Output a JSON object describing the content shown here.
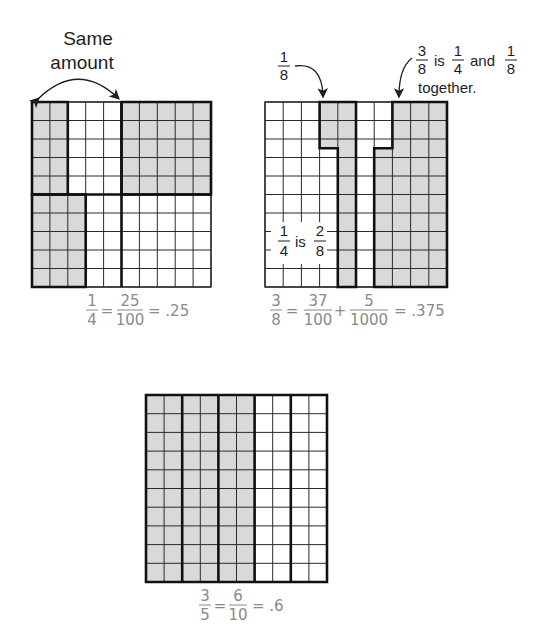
{
  "colors": {
    "shade": "#d9d9d9",
    "grid_line": "#2a2a2a",
    "bold_line": "#111111",
    "label_text": "#1e1e1e",
    "equation_text": "#8a8a8a",
    "background": "#ffffff"
  },
  "panels": [
    {
      "id": "quarter",
      "grid": {
        "x": 32,
        "y": 102,
        "w": 179,
        "h": 185,
        "rows": 10,
        "cols": 10
      },
      "shaded_regions": [
        {
          "col_start": 0,
          "col_end": 2,
          "row_start": 0,
          "row_end": 5
        },
        {
          "col_start": 5,
          "col_end": 10,
          "row_start": 0,
          "row_end": 5
        },
        {
          "col_start": 0,
          "col_end": 3,
          "row_start": 5,
          "row_end": 10
        }
      ],
      "bold_outlines": [
        [
          [
            0,
            0
          ],
          [
            2,
            0
          ],
          [
            2,
            5
          ],
          [
            0,
            5
          ]
        ],
        [
          [
            5,
            0
          ],
          [
            10,
            0
          ],
          [
            10,
            5
          ],
          [
            5,
            5
          ]
        ],
        [
          [
            0,
            5
          ],
          [
            3,
            5
          ],
          [
            3,
            10
          ],
          [
            0,
            10
          ]
        ],
        [
          [
            0,
            5
          ],
          [
            10,
            5
          ]
        ],
        [
          [
            5,
            0
          ],
          [
            5,
            10
          ]
        ]
      ],
      "annotation": {
        "line1": "Same",
        "line2": "amount"
      },
      "equation": {
        "f1_num": "1",
        "f1_den": "4",
        "eq1": "=",
        "f2_num": "25",
        "f2_den": "100",
        "eq2": "= .25"
      }
    },
    {
      "id": "three-eighths",
      "grid": {
        "x": 265,
        "y": 102,
        "w": 182,
        "h": 185,
        "rows": 10,
        "cols": 10
      },
      "shaded_regions": [
        {
          "col_start": 3,
          "col_end": 4,
          "row_start": 0,
          "row_end": 2.5
        },
        {
          "col_start": 4,
          "col_end": 5,
          "row_start": 0,
          "row_end": 10
        },
        {
          "col_start": 6,
          "col_end": 7,
          "row_start": 2.5,
          "row_end": 10
        },
        {
          "col_start": 7,
          "col_end": 10,
          "row_start": 0,
          "row_end": 10
        }
      ],
      "bold_outlines": [
        [
          [
            3,
            0
          ],
          [
            5,
            0
          ],
          [
            5,
            10
          ],
          [
            4,
            10
          ],
          [
            4,
            2.5
          ],
          [
            3,
            2.5
          ]
        ],
        [
          [
            7,
            0
          ],
          [
            10,
            0
          ],
          [
            10,
            10
          ],
          [
            6,
            10
          ],
          [
            6,
            2.5
          ],
          [
            7,
            2.5
          ]
        ]
      ],
      "annotation_eighth": {
        "num": "1",
        "den": "8"
      },
      "annotation_combined": {
        "f1_num": "3",
        "f1_den": "8",
        "is": "is",
        "f2_num": "1",
        "f2_den": "4",
        "and": "and",
        "f3_num": "1",
        "f3_den": "8",
        "line2": "together."
      },
      "inner_label": {
        "f1_num": "1",
        "f1_den": "4",
        "is": "is",
        "f2_num": "2",
        "f2_den": "8"
      },
      "equation": {
        "f1_num": "3",
        "f1_den": "8",
        "eq1": "=",
        "f2_num": "37",
        "f2_den": "100",
        "plus": "+",
        "f3_num": "5",
        "f3_den": "1000",
        "eq2": "= .375"
      }
    },
    {
      "id": "three-fifths",
      "grid": {
        "x": 146,
        "y": 395,
        "w": 181,
        "h": 187,
        "rows": 10,
        "cols": 10
      },
      "shaded_regions": [
        {
          "col_start": 0,
          "col_end": 6,
          "row_start": 0,
          "row_end": 10
        }
      ],
      "bold_outlines": [
        [
          [
            0,
            0
          ],
          [
            10,
            0
          ],
          [
            10,
            10
          ],
          [
            0,
            10
          ]
        ],
        [
          [
            2,
            0
          ],
          [
            2,
            10
          ]
        ],
        [
          [
            4,
            0
          ],
          [
            4,
            10
          ]
        ],
        [
          [
            6,
            0
          ],
          [
            6,
            10
          ]
        ],
        [
          [
            8,
            0
          ],
          [
            8,
            10
          ]
        ]
      ],
      "equation": {
        "f1_num": "3",
        "f1_den": "5",
        "eq1": "=",
        "f2_num": "6",
        "f2_den": "10",
        "eq2": "= .6"
      }
    }
  ]
}
